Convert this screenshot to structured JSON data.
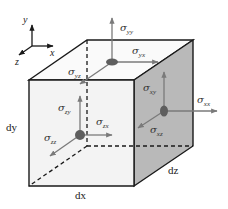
{
  "diagram": {
    "axes": {
      "x": "x",
      "y": "y",
      "z": "z"
    },
    "dimensions": {
      "dx": "dx",
      "dy": "dy",
      "dz": "dz"
    },
    "stresses": {
      "top_face": [
        {
          "sym": "σ",
          "sub": "yy"
        },
        {
          "sym": "σ",
          "sub": "yx"
        },
        {
          "sym": "σ",
          "sub": "yz"
        }
      ],
      "front_face": [
        {
          "sym": "σ",
          "sub": "zy"
        },
        {
          "sym": "σ",
          "sub": "zx"
        },
        {
          "sym": "σ",
          "sub": "zz"
        }
      ],
      "right_face": [
        {
          "sym": "σ",
          "sub": "xy"
        },
        {
          "sym": "σ",
          "sub": "xx"
        },
        {
          "sym": "σ",
          "sub": "xz"
        }
      ]
    },
    "colors": {
      "edge": "#1a1a1a",
      "arrow": "#7a7a7a",
      "dot": "#5e5e5e",
      "front_face": "#f3f3f3",
      "top_face": "#fafafa",
      "right_face": "#b9b9b9"
    }
  }
}
